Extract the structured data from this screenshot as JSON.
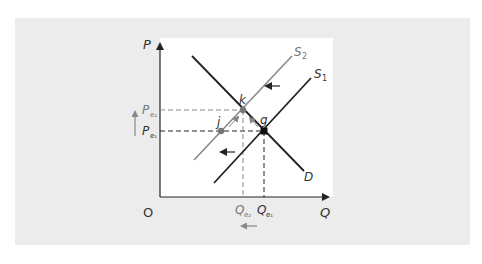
{
  "diagram": {
    "axes": {
      "y_label": "P",
      "x_label": "Q",
      "origin_label": "O"
    },
    "curves": {
      "demand": {
        "label": "D",
        "color": "#222222"
      },
      "supply_1": {
        "label": "S",
        "sub": "1",
        "color": "#222222"
      },
      "supply_2": {
        "label": "S",
        "sub": "2",
        "color": "#8a8a8a"
      }
    },
    "points": {
      "k": {
        "label": "k",
        "color": "#777777"
      },
      "g": {
        "label": "g",
        "color": "#111111"
      },
      "j": {
        "label": "j",
        "color": "#777777"
      }
    },
    "price_levels": {
      "pe2": {
        "label": "P",
        "sub": "e₂"
      },
      "pe1": {
        "label": "P",
        "sub": "e₁"
      }
    },
    "quantity_levels": {
      "qe2": {
        "label": "Q",
        "sub": "e₂"
      },
      "qe1": {
        "label": "Q",
        "sub": "e₁"
      }
    },
    "arrows": {
      "supply_shift": "left-arrow",
      "price_change": "up-arrow",
      "quantity_change": "left-arrow",
      "movement_along_curves": "diagonal-arrows-to-k"
    },
    "colors": {
      "background": "#ececec",
      "panel": "#ffffff",
      "primary_line": "#222222",
      "secondary_line": "#8a8a8a"
    }
  }
}
